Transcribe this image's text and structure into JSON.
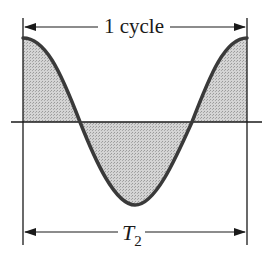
{
  "diagram": {
    "top_dimension": {
      "label": "1 cycle"
    },
    "bottom_dimension": {
      "label_main": "T",
      "label_sub": "2"
    },
    "colors": {
      "curve": "#3a3a3a",
      "fill": "#c8c8c8",
      "lines": "#1a1a1a",
      "background": "#ffffff"
    },
    "waveform": {
      "type": "cosine",
      "cycles": 1,
      "x_start": 23,
      "x_end": 247,
      "y_axis": 122,
      "amplitude": 84
    }
  }
}
